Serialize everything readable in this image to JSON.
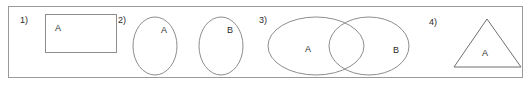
{
  "panel": {
    "border_color": "#9a9a9a",
    "background": "#ffffff",
    "stroke_color": "#8d8d8d",
    "text_color": "#2b2b2b"
  },
  "figures": [
    {
      "number": "1)",
      "shape": "rectangle",
      "labels": [
        "A"
      ],
      "description": "rectangle containing set A"
    },
    {
      "number": "2)",
      "shape": "two-disjoint-ellipses",
      "labels": [
        "A",
        "B"
      ],
      "description": "two separate ellipses labeled A and B"
    },
    {
      "number": "3)",
      "shape": "venn-two-overlapping-ellipses",
      "labels": [
        "A",
        "B"
      ],
      "description": "two overlapping ellipses labeled A and B"
    },
    {
      "number": "4)",
      "shape": "triangle",
      "labels": [
        "A"
      ],
      "description": "triangle containing set A"
    }
  ]
}
